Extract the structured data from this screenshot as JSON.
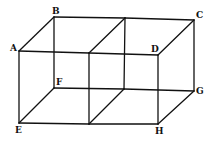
{
  "diagram": {
    "type": "double-cuboid wireframe",
    "line_color": "#111111",
    "vertices": {
      "A": {
        "x": 19,
        "y": 51,
        "label": "A",
        "lx": 10,
        "ly": 51
      },
      "B": {
        "x": 54,
        "y": 17,
        "label": "B",
        "lx": 52,
        "ly": 14
      },
      "C": {
        "x": 194,
        "y": 20,
        "label": "C",
        "lx": 196,
        "ly": 18
      },
      "D": {
        "x": 158,
        "y": 55,
        "label": "D",
        "lx": 151,
        "ly": 52
      },
      "E": {
        "x": 19,
        "y": 123,
        "label": "E",
        "lx": 15,
        "ly": 133
      },
      "F": {
        "x": 54,
        "y": 88,
        "label": "F",
        "lx": 56,
        "ly": 85
      },
      "G": {
        "x": 194,
        "y": 91,
        "label": "G",
        "lx": 196,
        "ly": 94
      },
      "H": {
        "x": 158,
        "y": 124,
        "label": "H",
        "lx": 155,
        "ly": 134
      },
      "M1": {
        "x": 89,
        "y": 53
      },
      "M2": {
        "x": 125,
        "y": 18
      },
      "M3": {
        "x": 89,
        "y": 124
      },
      "M4": {
        "x": 124,
        "y": 89
      }
    },
    "edges": [
      [
        "A",
        "B"
      ],
      [
        "B",
        "M2"
      ],
      [
        "M2",
        "C"
      ],
      [
        "A",
        "M1"
      ],
      [
        "M1",
        "D"
      ],
      [
        "D",
        "C"
      ],
      [
        "M1",
        "M2"
      ],
      [
        "A",
        "E"
      ],
      [
        "B",
        "F"
      ],
      [
        "C",
        "G"
      ],
      [
        "D",
        "H"
      ],
      [
        "M1",
        "M3"
      ],
      [
        "M2",
        "M4"
      ],
      [
        "E",
        "M3"
      ],
      [
        "M3",
        "H"
      ],
      [
        "F",
        "M4"
      ],
      [
        "M4",
        "G"
      ],
      [
        "E",
        "F"
      ],
      [
        "H",
        "G"
      ],
      [
        "M3",
        "M4"
      ]
    ],
    "labels": [
      "A",
      "B",
      "C",
      "D",
      "E",
      "F",
      "G",
      "H"
    ]
  }
}
